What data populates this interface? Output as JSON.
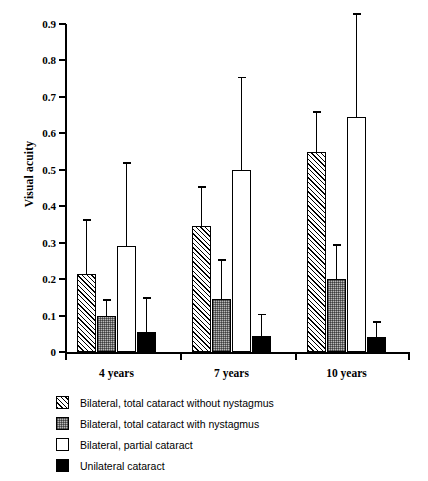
{
  "chart_data": {
    "type": "bar",
    "title": "",
    "xlabel": "",
    "ylabel": "Visual acuity",
    "categories": [
      "4 years",
      "7 years",
      "10 years"
    ],
    "ylim": [
      0,
      0.9
    ],
    "ytick_values": [
      0,
      0.1,
      0.2,
      0.3,
      0.4,
      0.5,
      0.6,
      0.7,
      0.8,
      0.9
    ],
    "ytick_labels": [
      "0",
      "0.1",
      "0.2",
      "0.3",
      "0.4",
      "0.5",
      "0.6",
      "0.7",
      "0.8",
      "0.9"
    ],
    "grid": false,
    "legend_position": "below",
    "error_bars": "upper only",
    "series": [
      {
        "name": "Bilateral, total cataract without nystagmus",
        "pattern": "diagonal-hatch",
        "values": [
          0.215,
          0.345,
          0.55
        ],
        "error_upper": [
          0.365,
          0.455,
          0.66
        ]
      },
      {
        "name": "Bilateral, total cataract with nystagmus",
        "pattern": "gray-stipple",
        "values": [
          0.1,
          0.145,
          0.2
        ],
        "error_upper": [
          0.145,
          0.255,
          0.295
        ]
      },
      {
        "name": "Bilateral, partial cataract",
        "pattern": "open-white",
        "values": [
          0.29,
          0.5,
          0.645
        ],
        "error_upper": [
          0.52,
          0.755,
          0.93
        ]
      },
      {
        "name": "Unilateral cataract",
        "pattern": "solid-black",
        "values": [
          0.055,
          0.045,
          0.04
        ],
        "error_upper": [
          0.15,
          0.105,
          0.085
        ]
      }
    ]
  },
  "legend": {
    "items": [
      {
        "label": "Bilateral, total cataract without nystagmus",
        "pattern": "diagonal-hatch"
      },
      {
        "label": "Bilateral, total cataract with nystagmus",
        "pattern": "gray-stipple"
      },
      {
        "label": "Bilateral, partial cataract",
        "pattern": "open-white"
      },
      {
        "label": "Unilateral cataract",
        "pattern": "solid-black"
      }
    ]
  },
  "colors": {
    "axis": "#000000",
    "bar_outline": "#000000",
    "stipple_fill": "#b9b9b9",
    "solid_fill": "#000000",
    "open_fill": "#ffffff",
    "background": "#ffffff"
  }
}
